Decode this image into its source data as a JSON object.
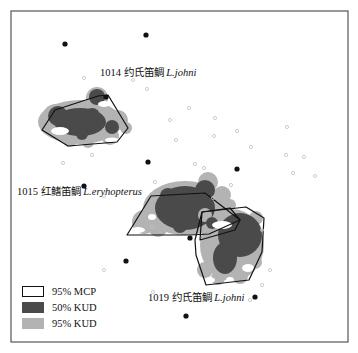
{
  "map": {
    "frame": {
      "x": 11,
      "y": 11,
      "width": 337,
      "height": 331,
      "stroke": "#555555"
    },
    "colors": {
      "mcp_stroke": "#111111",
      "kud50": "#4a4a4a",
      "kud95": "#b3b3b3",
      "receiver": "#111111",
      "detection": "#c8c8c8"
    },
    "labels": [
      {
        "id": "fish-1014",
        "number": "1014",
        "cn": "约氏笛鲷",
        "latin": "L.johni",
        "x": 100,
        "y": 67
      },
      {
        "id": "fish-1015",
        "number": "1015",
        "cn": "红鳍笛鲷",
        "latin": "L.eryhopterus",
        "x": 17,
        "y": 186
      },
      {
        "id": "fish-1019",
        "number": "1019",
        "cn": "约氏笛鲷",
        "latin": "L.johni",
        "x": 150,
        "y": 292
      }
    ],
    "legend": [
      {
        "label": "95% MCP",
        "type": "mcp"
      },
      {
        "label": "50% KUD",
        "type": "kud50"
      },
      {
        "label": "95% KUD",
        "type": "kud95"
      }
    ],
    "receivers": [
      [
        65,
        44
      ],
      [
        146,
        35
      ],
      [
        98,
        91
      ],
      [
        148,
        162
      ],
      [
        237,
        169
      ],
      [
        84,
        186
      ],
      [
        190,
        238
      ],
      [
        126,
        261
      ],
      [
        148,
        312
      ],
      [
        255,
        297
      ],
      [
        186,
        317
      ]
    ],
    "detections": [
      [
        84,
        78
      ],
      [
        133,
        80
      ],
      [
        147,
        89
      ],
      [
        189,
        108
      ],
      [
        215,
        118
      ],
      [
        170,
        120
      ],
      [
        237,
        131
      ],
      [
        214,
        136
      ],
      [
        287,
        127
      ],
      [
        251,
        147
      ],
      [
        286,
        155
      ],
      [
        304,
        157
      ],
      [
        285,
        161
      ],
      [
        293,
        173
      ],
      [
        315,
        176
      ],
      [
        231,
        185
      ],
      [
        213,
        198
      ],
      [
        63,
        163
      ],
      [
        92,
        155
      ],
      [
        64,
        162
      ],
      [
        104,
        196
      ],
      [
        155,
        182
      ],
      [
        176,
        140
      ],
      [
        195,
        164
      ],
      [
        262,
        230
      ],
      [
        270,
        270
      ],
      [
        262,
        285
      ],
      [
        153,
        292
      ],
      [
        152,
        227
      ],
      [
        250,
        300
      ],
      [
        240,
        340
      ]
    ],
    "mcp_polygons": [
      {
        "fish": "1014",
        "points": [
          [
            42,
            130
          ],
          [
            55,
            110
          ],
          [
            98,
            96
          ],
          [
            108,
            95
          ],
          [
            128,
            128
          ],
          [
            117,
            142
          ],
          [
            68,
            146
          ]
        ]
      },
      {
        "fish": "1015",
        "points": [
          [
            127,
            235
          ],
          [
            151,
            196
          ],
          [
            205,
            193
          ],
          [
            240,
            220
          ],
          [
            209,
            234
          ],
          [
            190,
            235
          ]
        ]
      },
      {
        "fish": "1019",
        "points": [
          [
            202,
            212
          ],
          [
            246,
            207
          ],
          [
            264,
            218
          ],
          [
            262,
            252
          ],
          [
            249,
            280
          ],
          [
            206,
            285
          ],
          [
            196,
            255
          ],
          [
            195,
            240
          ]
        ]
      },
      {
        "fish": "1019b",
        "points": [
          [
            202,
            212
          ],
          [
            230,
            208
          ],
          [
            240,
            220
          ],
          [
            235,
            230
          ],
          [
            200,
            240
          ]
        ]
      }
    ]
  }
}
